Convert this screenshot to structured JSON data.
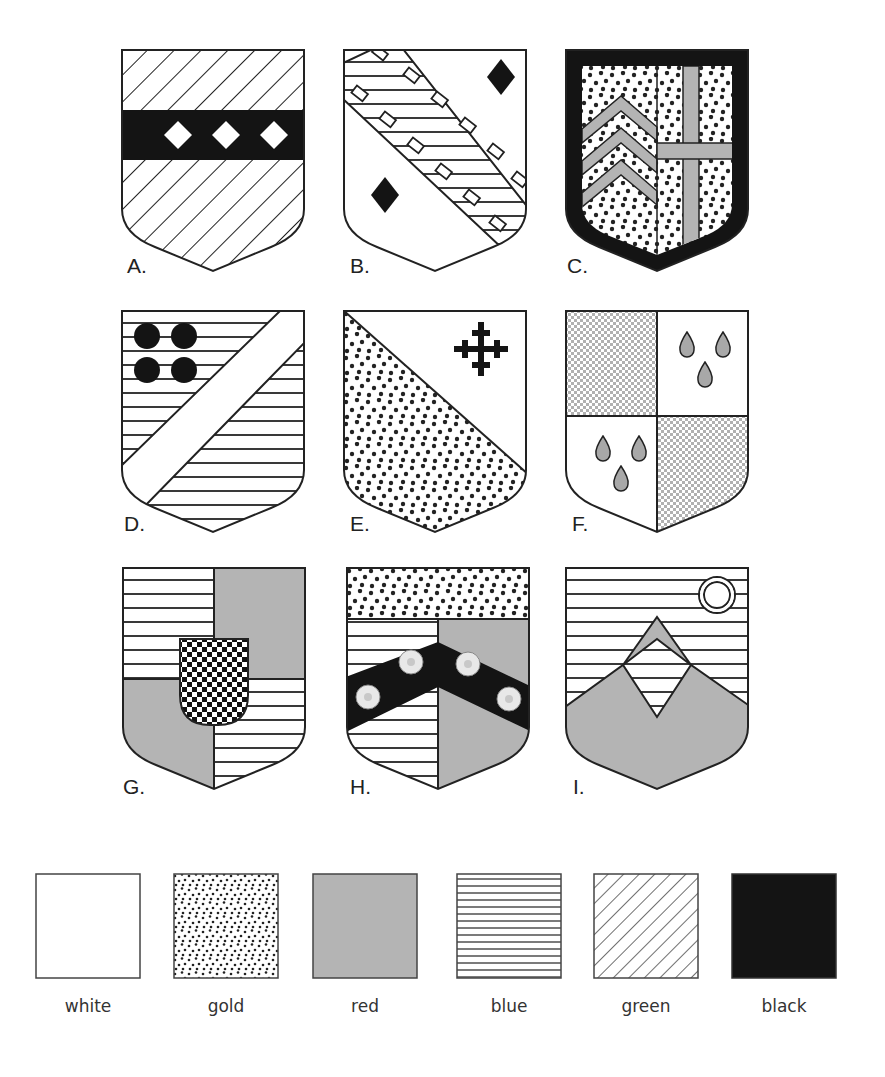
{
  "figure": {
    "shields": [
      {
        "id": "A",
        "label": "A.",
        "description": "green field, black fess charged with three white lozenges"
      },
      {
        "id": "B",
        "label": "B.",
        "description": "white field, blue bend embattled-counter-embattled, two black lozenges"
      },
      {
        "id": "C",
        "label": "C.",
        "description": "black bordure; gold field per pale with three red chevronels and red cross"
      },
      {
        "id": "D",
        "label": "D.",
        "description": "blue field, white bend sinister, four black roundels"
      },
      {
        "id": "E",
        "label": "E.",
        "description": "per bend sinister white and gold, black cross crosslet"
      },
      {
        "id": "F",
        "label": "F.",
        "description": "quarterly checky and white, red gouttes"
      },
      {
        "id": "G",
        "label": "G.",
        "description": "quarterly blue and red, checky inescutcheon"
      },
      {
        "id": "H",
        "label": "H.",
        "description": "gold chief, per pale blue and red, black chevron with four white roses"
      },
      {
        "id": "I",
        "label": "I.",
        "description": "blue field, red mount with pile, white annulet"
      }
    ]
  },
  "legend": {
    "items": [
      {
        "name": "white",
        "label": "white"
      },
      {
        "name": "gold",
        "label": "gold"
      },
      {
        "name": "red",
        "label": "red"
      },
      {
        "name": "blue",
        "label": "blue"
      },
      {
        "name": "green",
        "label": "green"
      },
      {
        "name": "black",
        "label": "black"
      }
    ]
  },
  "colors": {
    "outline": "#222222",
    "red_fill": "#b4b4b4",
    "black_fill": "#141414",
    "white_fill": "#ffffff"
  }
}
